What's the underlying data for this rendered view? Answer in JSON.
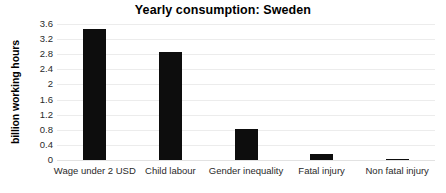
{
  "chart_data": {
    "type": "bar",
    "title": "Yearly consumption: Sweden",
    "xlabel": "",
    "ylabel": "billion working hours",
    "categories": [
      "Wage under 2 USD",
      "Child labour",
      "Gender inequality",
      "Fatal injury",
      "Non fatal injury"
    ],
    "values": [
      3.47,
      2.85,
      0.83,
      0.15,
      0.02
    ],
    "ylim": [
      0,
      3.6
    ],
    "ytick_labels": [
      "3.6",
      "3.2",
      "2.8",
      "2.4",
      "2",
      "1.6",
      "1.2",
      "0.8",
      "0.4",
      "0"
    ],
    "ytick_values": [
      3.6,
      3.2,
      2.8,
      2.4,
      2.0,
      1.6,
      1.2,
      0.8,
      0.4,
      0
    ],
    "grid": true,
    "legend": false,
    "bar_color": "#0d0d0d",
    "grid_color": "#ececec",
    "background_color": "#ffffff"
  }
}
